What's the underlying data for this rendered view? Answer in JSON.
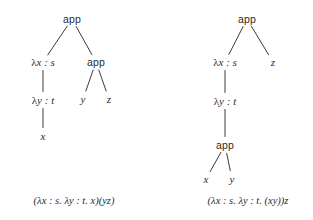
{
  "figure": {
    "background_color": "#ffffff",
    "ink_color": "#2b2b2b",
    "edge_color": "#3a3a3a"
  },
  "trees": [
    {
      "id": "left-tree",
      "caption": "(λx : s. λy : t. x)(yz)",
      "nodes": [
        {
          "id": "l-root",
          "label": "app",
          "kind": "app",
          "x": 72,
          "y": 19
        },
        {
          "id": "l-lamx",
          "label": "λx : s",
          "kind": "term",
          "x": 43,
          "y": 62
        },
        {
          "id": "l-app2",
          "label": "app",
          "kind": "app",
          "x": 96,
          "y": 62
        },
        {
          "id": "l-lamy",
          "label": "λy : t",
          "kind": "term",
          "x": 43,
          "y": 100
        },
        {
          "id": "l-y",
          "label": "y",
          "kind": "var",
          "x": 83,
          "y": 99
        },
        {
          "id": "l-z",
          "label": "z",
          "kind": "var",
          "x": 109,
          "y": 99
        },
        {
          "id": "l-x",
          "label": "x",
          "kind": "var",
          "x": 43,
          "y": 136
        }
      ],
      "edges": [
        {
          "from": "l-root",
          "to": "l-lamx"
        },
        {
          "from": "l-root",
          "to": "l-app2"
        },
        {
          "from": "l-lamx",
          "to": "l-lamy"
        },
        {
          "from": "l-lamy",
          "to": "l-x"
        },
        {
          "from": "l-app2",
          "to": "l-y"
        },
        {
          "from": "l-app2",
          "to": "l-z"
        }
      ]
    },
    {
      "id": "right-tree",
      "caption": "(λx : s. λy : t. (xy))z",
      "nodes": [
        {
          "id": "r-root",
          "label": "app",
          "kind": "app",
          "x": 247,
          "y": 19
        },
        {
          "id": "r-lamx",
          "label": "λx : s",
          "kind": "term",
          "x": 225,
          "y": 62
        },
        {
          "id": "r-z",
          "label": "z",
          "kind": "var",
          "x": 273,
          "y": 62
        },
        {
          "id": "r-lamy",
          "label": "λy : t",
          "kind": "term",
          "x": 225,
          "y": 101
        },
        {
          "id": "r-app2",
          "label": "app",
          "kind": "app",
          "x": 225,
          "y": 145
        },
        {
          "id": "r-x",
          "label": "x",
          "kind": "var",
          "x": 206,
          "y": 179
        },
        {
          "id": "r-y",
          "label": "y",
          "kind": "var",
          "x": 232,
          "y": 179
        }
      ],
      "edges": [
        {
          "from": "r-root",
          "to": "r-lamx"
        },
        {
          "from": "r-root",
          "to": "r-z"
        },
        {
          "from": "r-lamx",
          "to": "r-lamy"
        },
        {
          "from": "r-lamy",
          "to": "r-app2"
        },
        {
          "from": "r-app2",
          "to": "r-x"
        },
        {
          "from": "r-app2",
          "to": "r-y"
        }
      ]
    }
  ],
  "captions": [
    {
      "id": "left-caption",
      "text": "(λx : s. λy : t. x)(yz)",
      "x": 74,
      "y": 201
    },
    {
      "id": "right-caption",
      "text": "(λx : s. λy : t. (xy))z",
      "x": 248,
      "y": 201
    }
  ]
}
